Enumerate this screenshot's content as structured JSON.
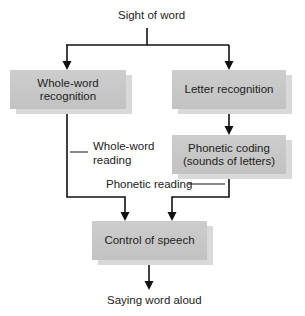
{
  "diagram": {
    "title_node": "Sight of word",
    "nodes": {
      "whole_word_recognition": "Whole-word recognition",
      "letter_recognition": "Letter recognition",
      "phonetic_coding_line1": "Phonetic coding",
      "phonetic_coding_line2": "(sounds of letters)",
      "control_of_speech": "Control of speech"
    },
    "path_labels": {
      "whole_word_reading_line1": "Whole-word",
      "whole_word_reading_line2": "reading",
      "phonetic_reading": "Phonetic reading"
    },
    "output_node": "Saying word aloud",
    "colors": {
      "box_fill": "#c8c8c8",
      "box_shadow": "#d9d9d9",
      "line": "#111111",
      "text": "#222222"
    }
  }
}
